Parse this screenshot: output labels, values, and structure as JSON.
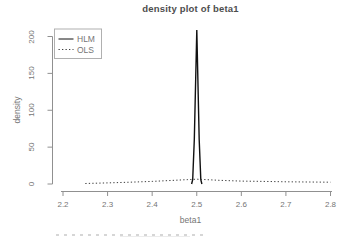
{
  "colors": {
    "background": "#ffffff",
    "axis": "#909090",
    "text": "#757575",
    "title": "#4d4d4d",
    "hlm_line": "#111111",
    "ols_line": "#3d3d3d",
    "legend_border": "#b0b0b0"
  },
  "chart_data": {
    "type": "line",
    "title": "density plot of beta1",
    "xlabel": "beta1",
    "ylabel": "density",
    "xlim": [
      2.2,
      2.8
    ],
    "ylim": [
      0,
      200
    ],
    "x_ticks": [
      2.2,
      2.3,
      2.4,
      2.5,
      2.6,
      2.7,
      2.8
    ],
    "y_ticks": [
      0,
      50,
      100,
      150,
      200
    ],
    "grid": false,
    "legend": {
      "position": "top-left",
      "entries": [
        {
          "label": "HLM",
          "style": "solid"
        },
        {
          "label": "OLS",
          "style": "dotted"
        }
      ]
    },
    "series": [
      {
        "name": "HLM",
        "style": "solid",
        "points": [
          [
            2.4885,
            0
          ],
          [
            2.491,
            6
          ],
          [
            2.4945,
            60
          ],
          [
            2.5,
            209
          ],
          [
            2.5055,
            60
          ],
          [
            2.509,
            6
          ],
          [
            2.5115,
            0
          ]
        ]
      },
      {
        "name": "OLS",
        "style": "dotted",
        "points": [
          [
            2.25,
            0.7
          ],
          [
            2.3,
            1.5
          ],
          [
            2.35,
            2.5
          ],
          [
            2.4,
            3.5
          ],
          [
            2.45,
            5
          ],
          [
            2.48,
            6
          ],
          [
            2.5,
            6.5
          ],
          [
            2.52,
            6
          ],
          [
            2.55,
            5
          ],
          [
            2.6,
            4
          ],
          [
            2.65,
            3.5
          ],
          [
            2.7,
            3
          ],
          [
            2.75,
            2.7
          ],
          [
            2.8,
            2.5
          ]
        ]
      }
    ]
  }
}
